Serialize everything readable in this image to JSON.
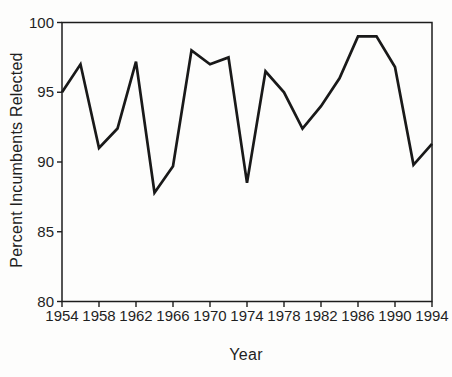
{
  "chart_data": {
    "type": "line",
    "title": "",
    "xlabel": "Year",
    "ylabel": "Percent Incumbents Relected",
    "x": [
      1954,
      1956,
      1958,
      1960,
      1962,
      1964,
      1966,
      1968,
      1970,
      1972,
      1974,
      1976,
      1978,
      1980,
      1982,
      1984,
      1986,
      1988,
      1990,
      1992,
      1994
    ],
    "values": [
      95.0,
      97.0,
      91.0,
      92.4,
      97.2,
      87.8,
      89.7,
      98.0,
      97.0,
      97.5,
      88.5,
      96.5,
      95.0,
      92.4,
      94.0,
      96.0,
      99.0,
      99.0,
      96.8,
      89.8,
      91.3
    ],
    "x_ticks": [
      1954,
      1958,
      1962,
      1966,
      1970,
      1974,
      1978,
      1982,
      1986,
      1990,
      1994
    ],
    "y_ticks": [
      100,
      95,
      90,
      85,
      80
    ],
    "xlim": [
      1954,
      1994
    ],
    "ylim": [
      80,
      100
    ],
    "grid": false,
    "legend": "none",
    "line_color": "#191919",
    "axis_color": "#1c1c1c",
    "text_color": "#1f1f1f",
    "background": "#fdfdfc"
  }
}
